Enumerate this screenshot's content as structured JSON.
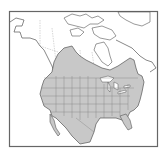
{
  "map": {
    "title": "",
    "region": "North America",
    "type": "species-range-map",
    "colors": {
      "background": "#ffffff",
      "range_fill": "#c8c8c8",
      "land_fill": "#ffffff",
      "outline": "#555555",
      "border_lines": "#888888",
      "frame": "#666666"
    },
    "layers": [
      {
        "name": "range",
        "label": "Distribution range",
        "fill": "#c8c8c8"
      },
      {
        "name": "coastlines",
        "label": "Coastlines"
      },
      {
        "name": "political-boundaries",
        "label": "State and province boundaries"
      }
    ]
  }
}
